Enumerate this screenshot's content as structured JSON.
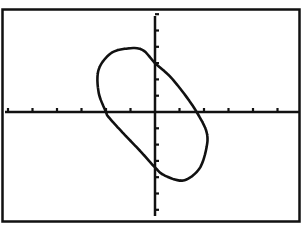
{
  "screen": {
    "title": "Graphing calculator graph screen",
    "background": "#ffffff",
    "ink": "#111111"
  },
  "chart_data": {
    "type": "line",
    "title": "",
    "xlabel": "",
    "ylabel": "",
    "window": {
      "xmin": -6,
      "xmax": 6,
      "xscl": 1,
      "ymin": -6.5,
      "ymax": 6.5,
      "yscl": 1
    },
    "grid": false,
    "legend": null,
    "series": [
      {
        "name": "ellipse",
        "style": "dotted-pixel",
        "points": [
          [
            -1.1,
            3.9
          ],
          [
            -0.5,
            3.8
          ],
          [
            0,
            3.0
          ],
          [
            0.6,
            2.2
          ],
          [
            1.2,
            1.1
          ],
          [
            1.7,
            0
          ],
          [
            2.1,
            -1.2
          ],
          [
            2.1,
            -2.2
          ],
          [
            1.8,
            -3.5
          ],
          [
            1.15,
            -4.2
          ],
          [
            0.4,
            -3.9
          ],
          [
            0,
            -3.4
          ],
          [
            -0.6,
            -2.4
          ],
          [
            -1.3,
            -1.3
          ],
          [
            -1.9,
            -0.3
          ],
          [
            -2.0,
            0
          ],
          [
            -2.3,
            1.2
          ],
          [
            -2.3,
            2.6
          ],
          [
            -1.8,
            3.6
          ]
        ],
        "x_intercepts": [
          -2.0,
          1.7
        ],
        "y_intercepts": [
          3.0,
          -3.4
        ]
      }
    ]
  }
}
